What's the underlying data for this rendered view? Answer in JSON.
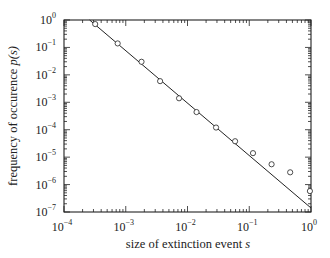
{
  "chart_data": {
    "type": "scatter",
    "title": "",
    "xlabel": "size of extinction event s",
    "ylabel": "frequency of occurence p(s)",
    "xscale": "log",
    "yscale": "log",
    "xlim": [
      0.0001,
      1
    ],
    "ylim": [
      1e-07,
      1
    ],
    "grid": false,
    "legend": null,
    "x_ticks": [
      "10^-4",
      "10^-3",
      "10^-2",
      "10^-1",
      "10^0"
    ],
    "y_ticks": [
      "10^-7",
      "10^-6",
      "10^-5",
      "10^-4",
      "10^-3",
      "10^-2",
      "10^-1",
      "10^0"
    ],
    "series": [
      {
        "name": "data",
        "style": "open-circles",
        "x": [
          0.00032,
          0.00074,
          0.0018,
          0.0036,
          0.0073,
          0.014,
          0.029,
          0.059,
          0.115,
          0.23,
          0.46,
          0.96
        ],
        "y": [
          0.71,
          0.14,
          0.03,
          0.0059,
          0.0014,
          0.00044,
          0.00012,
          3.8e-05,
          1.4e-05,
          5.5e-06,
          2.8e-06,
          5.8e-07
        ]
      },
      {
        "name": "power-law fit",
        "style": "line",
        "x": [
          0.00026,
          1
        ],
        "y": [
          1,
          1.4e-07
        ]
      }
    ]
  },
  "colors": {
    "ink": "#222222",
    "background": "#ffffff"
  }
}
